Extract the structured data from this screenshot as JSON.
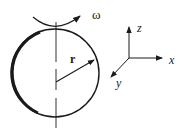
{
  "diagram": {
    "labels": {
      "omega": "ω",
      "radius": "r",
      "x_axis": "x",
      "y_axis": "y",
      "z_axis": "z"
    },
    "colors": {
      "stroke": "#1a1a1a",
      "background": "#ffffff"
    }
  }
}
